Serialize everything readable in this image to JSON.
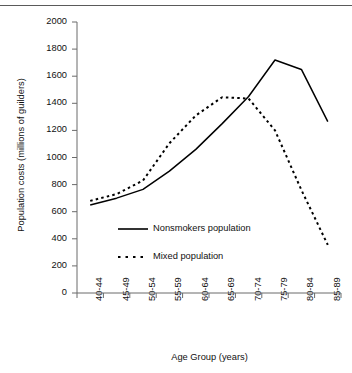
{
  "chart_data": {
    "type": "line",
    "title": "",
    "xlabel": "Age Group (years)",
    "ylabel": "Population costs (millions of guilders)",
    "categories": [
      "40-44",
      "45-49",
      "50-54",
      "55-59",
      "60-64",
      "65-69",
      "70-74",
      "75-79",
      "80-84",
      "85-89"
    ],
    "ylim": [
      0,
      2000
    ],
    "yticks": [
      0,
      200,
      400,
      600,
      800,
      1000,
      1200,
      1400,
      1600,
      1800,
      2000
    ],
    "ytick_labels": [
      "0",
      "200",
      "400",
      "600",
      "800",
      "1000",
      "1200",
      "1400",
      "1600",
      "1800",
      "2000"
    ],
    "grid": false,
    "legend_position": "center",
    "series": [
      {
        "name": "Nonsmokers population",
        "style": "solid",
        "color": "#000000",
        "values": [
          650,
          700,
          765,
          900,
          1060,
          1250,
          1450,
          1720,
          1650,
          1265
        ]
      },
      {
        "name": "Mixed population",
        "style": "dashed",
        "color": "#000000",
        "values": [
          680,
          730,
          830,
          1105,
          1310,
          1445,
          1435,
          1200,
          760,
          355
        ]
      }
    ]
  },
  "legend": {
    "items": [
      {
        "label": "Nonsmokers population",
        "style": "solid"
      },
      {
        "label": "Mixed population",
        "style": "dashed"
      }
    ]
  }
}
